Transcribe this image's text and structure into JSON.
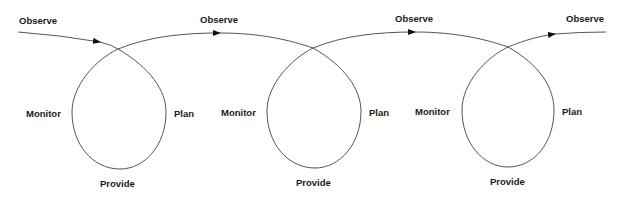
{
  "diagram": {
    "type": "spiral-cycle",
    "line_color": "#555555",
    "cycles": [
      {
        "observe": "Observe",
        "plan": "Plan",
        "provide": "Provide",
        "monitor": "Monitor"
      },
      {
        "observe": "Observe",
        "plan": "Plan",
        "provide": "Provide",
        "monitor": "Monitor"
      },
      {
        "observe": "Observe",
        "plan": "Plan",
        "provide": "Provide",
        "monitor": "Monitor"
      }
    ],
    "final_label": "Observe"
  }
}
